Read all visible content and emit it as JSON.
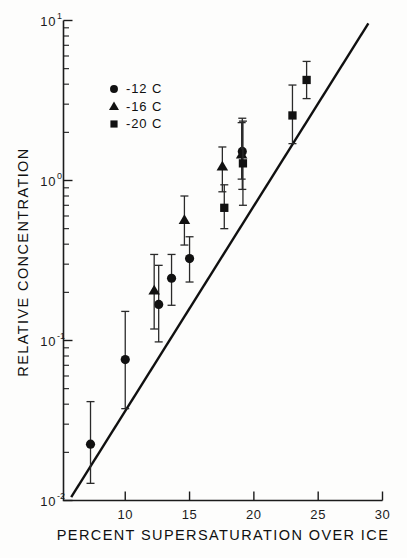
{
  "chart_data": {
    "type": "scatter",
    "title": "",
    "xlabel": "PERCENT SUPERSATURATION OVER ICE",
    "ylabel": "RELATIVE CONCENTRATION",
    "xscale": "linear",
    "yscale": "log",
    "xlim": [
      5.2,
      30
    ],
    "ylim": [
      0.01,
      10
    ],
    "grid": false,
    "xticks": [
      10,
      15,
      20,
      25,
      30
    ],
    "xtick_labels": [
      "10",
      "15",
      "20",
      "25",
      "30"
    ],
    "yticks": [
      0.01,
      0.1,
      1,
      10
    ],
    "ytick_labels": [
      "10-2",
      "10-1",
      "100",
      "101"
    ],
    "ytick_mantissa": [
      "10",
      "10",
      "10",
      "10"
    ],
    "ytick_exponent": [
      "-2",
      "-1",
      "0",
      "1"
    ],
    "legend_position": "upper-left-inside",
    "legend": [
      {
        "marker": "circle",
        "label": "-12 C"
      },
      {
        "marker": "triangle",
        "label": "-16 C"
      },
      {
        "marker": "square",
        "label": "-20 C"
      }
    ],
    "fit_line": {
      "label": "best-fit line",
      "x_start": 5.8,
      "y_start": 0.0105,
      "x_end": 28.9,
      "y_end": 9.6
    },
    "series": [
      {
        "name": "-12 C",
        "marker": "circle",
        "points": [
          {
            "x": 7.3,
            "y": 0.0225,
            "yerr_low": 0.0128,
            "yerr_high": 0.0415
          },
          {
            "x": 10.0,
            "y": 0.076,
            "yerr_low": 0.0375,
            "yerr_high": 0.152
          },
          {
            "x": 12.6,
            "y": 0.168,
            "yerr_low": 0.098,
            "yerr_high": 0.295
          },
          {
            "x": 13.6,
            "y": 0.245,
            "yerr_low": 0.166,
            "yerr_high": 0.345
          },
          {
            "x": 15.0,
            "y": 0.325,
            "yerr_low": 0.232,
            "yerr_high": 0.445
          },
          {
            "x": 19.1,
            "y": 1.52,
            "yerr_low": 0.88,
            "yerr_high": 2.45
          }
        ]
      },
      {
        "name": "-16 C",
        "marker": "triangle",
        "points": [
          {
            "x": 12.25,
            "y": 0.205,
            "yerr_low": 0.118,
            "yerr_high": 0.345
          },
          {
            "x": 14.6,
            "y": 0.565,
            "yerr_low": 0.395,
            "yerr_high": 0.8
          },
          {
            "x": 17.55,
            "y": 1.22,
            "yerr_low": 0.85,
            "yerr_high": 1.62
          },
          {
            "x": 19.05,
            "y": 1.45,
            "yerr_low": 1.02,
            "yerr_high": 2.3
          }
        ]
      },
      {
        "name": "-20 C",
        "marker": "square",
        "points": [
          {
            "x": 17.7,
            "y": 0.675,
            "yerr_low": 0.5,
            "yerr_high": 0.94
          },
          {
            "x": 19.15,
            "y": 1.28,
            "yerr_low": 0.7,
            "yerr_high": 2.35
          },
          {
            "x": 23.0,
            "y": 2.55,
            "yerr_low": 1.7,
            "yerr_high": 3.95
          },
          {
            "x": 24.1,
            "y": 4.25,
            "yerr_low": 3.25,
            "yerr_high": 5.55
          }
        ]
      }
    ]
  },
  "figure": {
    "background": "#fdfdfc",
    "ink_color": "#111111"
  }
}
